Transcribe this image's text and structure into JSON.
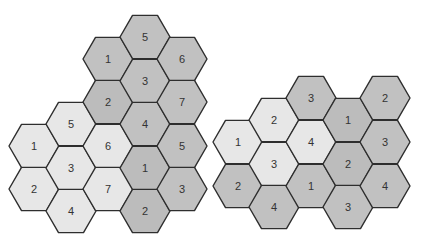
{
  "colors": {
    "background": "#ffffff",
    "stroke": "#2e2e2e",
    "light_cell": "#e7e7e7",
    "dark_cell": "#c1c1c1",
    "dark_cell_alt": "#bcbcbc",
    "label": "#333333"
  },
  "hex_radius": 25,
  "figures": [
    {
      "name": "seven-cell-cluster-figure",
      "cells": [
        {
          "label": "1",
          "cx": 34,
          "cy": 146,
          "shade": "light"
        },
        {
          "label": "2",
          "cx": 34,
          "cy": 189,
          "shade": "light"
        },
        {
          "label": "5",
          "cx": 71,
          "cy": 124,
          "shade": "light"
        },
        {
          "label": "3",
          "cx": 71,
          "cy": 168,
          "shade": "light"
        },
        {
          "label": "4",
          "cx": 71,
          "cy": 211,
          "shade": "light"
        },
        {
          "label": "1",
          "cx": 108,
          "cy": 59,
          "shade": "dark"
        },
        {
          "label": "2",
          "cx": 108,
          "cy": 102,
          "shade": "dark_alt"
        },
        {
          "label": "6",
          "cx": 108,
          "cy": 146,
          "shade": "light"
        },
        {
          "label": "7",
          "cx": 108,
          "cy": 189,
          "shade": "light"
        },
        {
          "label": "5",
          "cx": 145,
          "cy": 37,
          "shade": "dark"
        },
        {
          "label": "3",
          "cx": 145,
          "cy": 81,
          "shade": "dark"
        },
        {
          "label": "4",
          "cx": 145,
          "cy": 124,
          "shade": "dark"
        },
        {
          "label": "1",
          "cx": 145,
          "cy": 168,
          "shade": "dark_alt"
        },
        {
          "label": "2",
          "cx": 145,
          "cy": 211,
          "shade": "dark_alt"
        },
        {
          "label": "6",
          "cx": 182,
          "cy": 59,
          "shade": "dark"
        },
        {
          "label": "7",
          "cx": 182,
          "cy": 102,
          "shade": "dark"
        },
        {
          "label": "5",
          "cx": 182,
          "cy": 146,
          "shade": "dark"
        },
        {
          "label": "3",
          "cx": 182,
          "cy": 189,
          "shade": "dark"
        }
      ]
    },
    {
      "name": "four-cell-cluster-figure",
      "cells": [
        {
          "label": "1",
          "cx": 238,
          "cy": 142,
          "shade": "light"
        },
        {
          "label": "2",
          "cx": 238,
          "cy": 186,
          "shade": "dark"
        },
        {
          "label": "2",
          "cx": 274,
          "cy": 120,
          "shade": "light"
        },
        {
          "label": "3",
          "cx": 274,
          "cy": 164,
          "shade": "light"
        },
        {
          "label": "4",
          "cx": 274,
          "cy": 207,
          "shade": "dark"
        },
        {
          "label": "3",
          "cx": 311,
          "cy": 98,
          "shade": "dark"
        },
        {
          "label": "4",
          "cx": 311,
          "cy": 142,
          "shade": "light"
        },
        {
          "label": "1",
          "cx": 311,
          "cy": 186,
          "shade": "dark"
        },
        {
          "label": "1",
          "cx": 348,
          "cy": 120,
          "shade": "dark_alt"
        },
        {
          "label": "2",
          "cx": 348,
          "cy": 164,
          "shade": "dark_alt"
        },
        {
          "label": "3",
          "cx": 348,
          "cy": 207,
          "shade": "dark"
        },
        {
          "label": "2",
          "cx": 385,
          "cy": 98,
          "shade": "dark"
        },
        {
          "label": "3",
          "cx": 385,
          "cy": 142,
          "shade": "dark"
        },
        {
          "label": "4",
          "cx": 385,
          "cy": 186,
          "shade": "dark"
        }
      ]
    }
  ]
}
